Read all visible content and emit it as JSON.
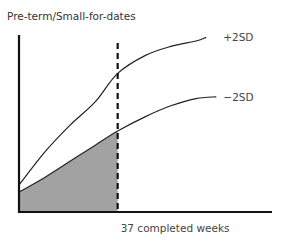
{
  "chart_data": {
    "type": "line",
    "title": "Pre-term/Small-for-dates",
    "xlabel": "",
    "ylabel": "",
    "xlim": [
      0,
      1
    ],
    "ylim": [
      0,
      1
    ],
    "grid": false,
    "legend": "inline-right",
    "annotations": [
      {
        "text": "37 completed weeks",
        "kind": "vertical-dashed-line",
        "x": 0.39
      }
    ],
    "shaded_region": {
      "description": "area below -2SD curve and left of 37 completed weeks",
      "color": "#a0a0a0"
    },
    "series": [
      {
        "name": "+2SD",
        "label": "+2SD",
        "x": [
          0.0,
          0.1,
          0.2,
          0.3,
          0.39,
          0.5,
          0.6,
          0.7,
          0.74
        ],
        "y": [
          0.15,
          0.33,
          0.48,
          0.61,
          0.77,
          0.87,
          0.92,
          0.95,
          0.97
        ]
      },
      {
        "name": "-2SD",
        "label": "−2SD",
        "x": [
          0.0,
          0.1,
          0.2,
          0.3,
          0.39,
          0.5,
          0.6,
          0.7,
          0.78
        ],
        "y": [
          0.11,
          0.19,
          0.28,
          0.37,
          0.45,
          0.53,
          0.59,
          0.63,
          0.64
        ]
      }
    ]
  }
}
